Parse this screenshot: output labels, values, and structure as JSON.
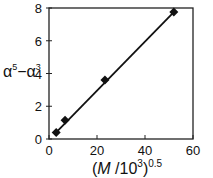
{
  "chart_data": {
    "type": "scatter",
    "title": "",
    "xlabel": "(M /10^3)^0.5",
    "ylabel": "α^5 − α^3",
    "xlim": [
      0,
      60
    ],
    "ylim": [
      0,
      8
    ],
    "xticks": [
      0,
      20,
      40,
      60
    ],
    "yticks": [
      0,
      2,
      4,
      6,
      8
    ],
    "grid": false,
    "legend": null,
    "series": [
      {
        "name": "data",
        "marker": "diamond",
        "x": [
          3.0,
          6.7,
          23.3,
          52.0
        ],
        "y": [
          0.4,
          1.15,
          3.6,
          7.75
        ]
      },
      {
        "name": "linear fit",
        "style": "line",
        "x": [
          3.0,
          52.0
        ],
        "y": [
          0.4,
          7.75
        ]
      }
    ]
  },
  "labels": {
    "x_main": "(M /10",
    "x_sup1": "3",
    "x_close": ")",
    "x_sup2": "0.5",
    "y_alpha1": "α",
    "y_sup1": "5",
    "y_minus": "−α",
    "y_sup2": "3"
  }
}
